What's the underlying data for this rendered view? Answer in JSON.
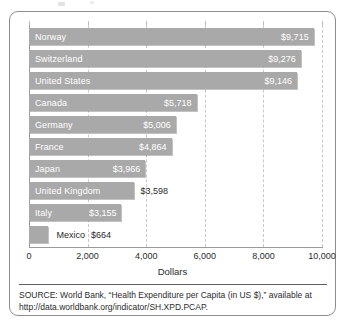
{
  "figure": {
    "axis_title": "Dollars",
    "source_note": "SOURCE: World Bank, “Health Expenditure per Capita (in US $),” available at http://data.worldbank.org/indicator/SH.XPD.PCAP."
  },
  "chart_data": {
    "type": "bar",
    "orientation": "horizontal",
    "title": "",
    "xlabel": "Dollars",
    "ylabel": "",
    "xlim": [
      0,
      10000
    ],
    "grid": true,
    "legend": false,
    "tick_labels": [
      "0",
      "2,000",
      "4,000",
      "6,000",
      "8,000",
      "10,000"
    ],
    "ticks": [
      0,
      2000,
      4000,
      6000,
      8000,
      10000
    ],
    "bar_color": "#a9a9a9",
    "categories": [
      "Norway",
      "Switzerland",
      "United States",
      "Canada",
      "Germany",
      "France",
      "Japan",
      "United Kingdom",
      "Italy",
      "Mexico"
    ],
    "values": [
      9715,
      9276,
      9146,
      5718,
      5006,
      4864,
      3966,
      3598,
      3155,
      664
    ],
    "value_labels": [
      "$9,715",
      "$9,276",
      "$9,146",
      "$5,718",
      "$5,006",
      "$4,864",
      "$3,966",
      "$3,598",
      "$3,155",
      "$664"
    ],
    "bars": [
      {
        "category": "Norway",
        "value": 9715,
        "label": "$9,715",
        "label_inside": true,
        "category_inside": true
      },
      {
        "category": "Switzerland",
        "value": 9276,
        "label": "$9,276",
        "label_inside": true,
        "category_inside": true
      },
      {
        "category": "United States",
        "value": 9146,
        "label": "$9,146",
        "label_inside": true,
        "category_inside": true
      },
      {
        "category": "Canada",
        "value": 5718,
        "label": "$5,718",
        "label_inside": true,
        "category_inside": true
      },
      {
        "category": "Germany",
        "value": 5006,
        "label": "$5,006",
        "label_inside": true,
        "category_inside": true
      },
      {
        "category": "France",
        "value": 4864,
        "label": "$4,864",
        "label_inside": true,
        "category_inside": true
      },
      {
        "category": "Japan",
        "value": 3966,
        "label": "$3,966",
        "label_inside": true,
        "category_inside": true
      },
      {
        "category": "United Kingdom",
        "value": 3598,
        "label": "$3,598",
        "label_inside": false,
        "category_inside": true
      },
      {
        "category": "Italy",
        "value": 3155,
        "label": "$3,155",
        "label_inside": true,
        "category_inside": true
      },
      {
        "category": "Mexico",
        "value": 664,
        "label": "$664",
        "label_inside": false,
        "category_inside": false
      }
    ]
  }
}
